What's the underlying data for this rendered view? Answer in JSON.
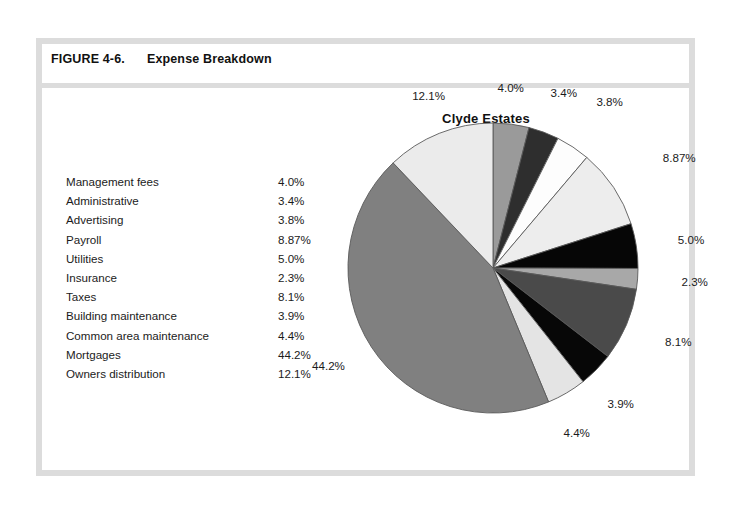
{
  "figure": {
    "number": "FIGURE 4-6.",
    "caption": "Expense Breakdown"
  },
  "legend": {
    "rows": [
      {
        "label": "Management fees",
        "value": "4.0%"
      },
      {
        "label": "Administrative",
        "value": "3.4%"
      },
      {
        "label": "Advertising",
        "value": "3.8%"
      },
      {
        "label": "Payroll",
        "value": "8.87%"
      },
      {
        "label": "Utilities",
        "value": "5.0%"
      },
      {
        "label": "Insurance",
        "value": "2.3%"
      },
      {
        "label": "Taxes",
        "value": "8.1%"
      },
      {
        "label": "Building maintenance",
        "value": "3.9%"
      },
      {
        "label": "Common area maintenance",
        "value": "4.4%"
      },
      {
        "label": "Mortgages",
        "value": "44.2%"
      },
      {
        "label": "Owners distribution",
        "value": "12.1%"
      }
    ]
  },
  "chart_data": {
    "type": "pie",
    "title": "Clyde Estates",
    "xlabel": "",
    "ylabel": "",
    "legend_position": "none",
    "grid": false,
    "start_angle_deg": 0,
    "direction": "clockwise",
    "categories": [
      "Management fees",
      "Administrative",
      "Advertising",
      "Payroll",
      "Utilities",
      "Insurance",
      "Taxes",
      "Building maintenance",
      "Common area maintenance",
      "Mortgages",
      "Owners distribution"
    ],
    "values": [
      4.0,
      3.4,
      3.8,
      8.87,
      5.0,
      2.3,
      8.1,
      3.9,
      4.4,
      44.2,
      12.1
    ],
    "labels": [
      "4.0%",
      "3.4%",
      "3.8%",
      "8.87%",
      "5.0%",
      "2.3%",
      "8.1%",
      "3.9%",
      "4.4%",
      "44.2%",
      "12.1%"
    ],
    "colors": [
      "#9a9a9a",
      "#2e2e2e",
      "#fdfdfd",
      "#ededed",
      "#060606",
      "#a8a8a8",
      "#4a4a4a",
      "#070707",
      "#e4e4e4",
      "#808080",
      "#ebebeb"
    ],
    "slice_border_color": "#5a5a5a",
    "label_color": "#1b1b1b"
  },
  "frame": {
    "border_color": "#dcdcdc",
    "background": "#ffffff"
  }
}
